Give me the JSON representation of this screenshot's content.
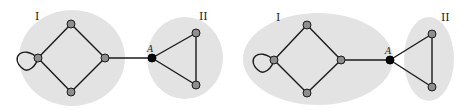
{
  "figure": {
    "panels": [
      {
        "id": "left",
        "region_labels": {
          "one": "I",
          "two": "II"
        },
        "articulation_label": "A",
        "description": "Two circular regions; region I contains a 4-node diamond with a self-loop on the left node; region II contains a triangle; they are connected by an edge from diamond's right node to node A."
      },
      {
        "id": "right",
        "region_labels": {
          "one": "I",
          "two": "II"
        },
        "articulation_label": "A",
        "description": "Region I is an enlarged ellipse now containing node A; region II is a narrow ellipse containing the two remaining triangle nodes."
      }
    ],
    "colors": {
      "region_fill": "#e3e3e3",
      "node_fill": "#8e8e8e",
      "articulation_node_fill": "#0a0a0a",
      "edge": "#1a1a1a"
    }
  }
}
